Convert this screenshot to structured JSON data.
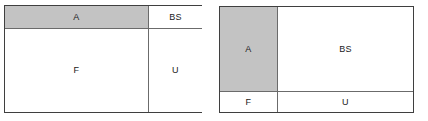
{
  "figure": {
    "background_color": "#ffffff",
    "border_color": "#3f3f3f",
    "divider_color": "#6b6b6b",
    "shaded_color": "#c3c3c3",
    "unshaded_color": "#ffffff",
    "text_color": "#1a1a1a"
  },
  "diagrams": [
    {
      "id": "left",
      "layout": "header-row-over-body-row",
      "cells": [
        {
          "id": "a",
          "label": "A",
          "fill": "shaded",
          "row": 0,
          "col": 0
        },
        {
          "id": "bs",
          "label": "BS",
          "fill": "unshaded",
          "row": 0,
          "col": 1
        },
        {
          "id": "f",
          "label": "F",
          "fill": "unshaded",
          "row": 1,
          "col": 0
        },
        {
          "id": "u",
          "label": "U",
          "fill": "unshaded",
          "row": 1,
          "col": 1
        }
      ]
    },
    {
      "id": "right",
      "layout": "tall-left-column-over-bottom-row",
      "cells": [
        {
          "id": "a",
          "label": "A",
          "fill": "shaded",
          "row": 0,
          "col": 0
        },
        {
          "id": "bs",
          "label": "BS",
          "fill": "unshaded",
          "row": 0,
          "col": 1
        },
        {
          "id": "f",
          "label": "F",
          "fill": "unshaded",
          "row": 1,
          "col": 0
        },
        {
          "id": "u",
          "label": "U",
          "fill": "unshaded",
          "row": 1,
          "col": 1
        }
      ]
    }
  ]
}
